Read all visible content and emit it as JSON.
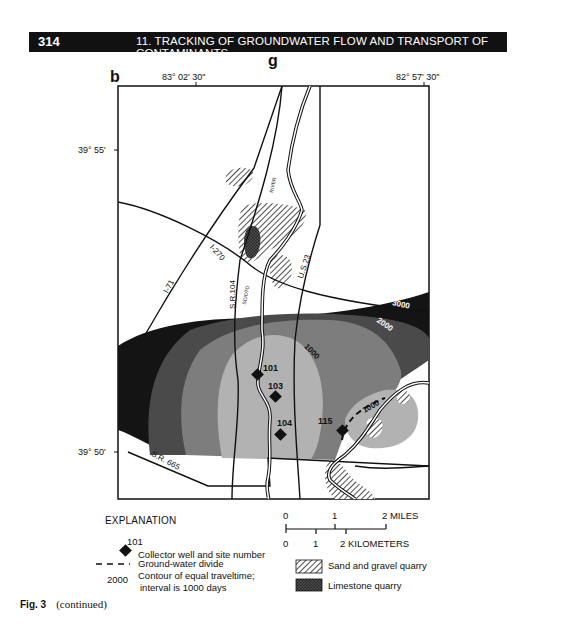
{
  "header": {
    "page_number": "314",
    "chapter_title": "11.  TRACKING OF GROUNDWATER FLOW AND TRANSPORT OF CONTAMINANTS"
  },
  "figure": {
    "panel_group_label": "g",
    "panel_label": "b",
    "coordinates": {
      "top_left_longitude": "83°  02' 30\"",
      "top_right_longitude": "82°  57' 30\"",
      "upper_latitude": "39° 55'",
      "lower_latitude": "39° 50'"
    },
    "roads": [
      "I-270",
      "I-71",
      "S.R.104",
      "U.S.23",
      "S.R. 665"
    ],
    "waterways": [
      "RIVER",
      "SCIOTO"
    ],
    "contour_labels": [
      "3000",
      "2000",
      "1000",
      "1000"
    ],
    "wells": [
      {
        "site_number": "101"
      },
      {
        "site_number": "103"
      },
      {
        "site_number": "104"
      },
      {
        "site_number": "115"
      }
    ],
    "colors": {
      "zone_3000": "#141414",
      "zone_2000": "#4a4a4a",
      "zone_1000_outer": "#7d7d7d",
      "zone_1000_inner": "#b2b2b2",
      "line": "#111111"
    }
  },
  "legend": {
    "title": "EXPLANATION",
    "items": [
      {
        "symbol_label": "101",
        "text": "Collector well and site number"
      },
      {
        "symbol_label": "",
        "text": "Ground-water divide"
      },
      {
        "symbol_label": "2000",
        "text": "Contour of equal traveltime;",
        "text2": "interval is 1000 days"
      },
      {
        "symbol_label": "",
        "text": "Sand and gravel quarry"
      },
      {
        "symbol_label": "",
        "text": "Limestone quarry"
      }
    ],
    "scale_miles": {
      "ticks": [
        "0",
        "1",
        "2 MILES"
      ]
    },
    "scale_km": {
      "ticks": [
        "0",
        "1",
        "2 KILOMETERS"
      ]
    }
  },
  "caption": {
    "figure_number": "Fig. 3",
    "note": "(continued)"
  }
}
